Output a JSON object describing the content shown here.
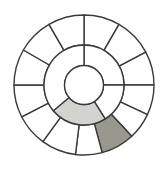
{
  "figure": {
    "type": "annular-wheel-diagram",
    "background": "#ffffff",
    "stroke_color": "#3a3a3a",
    "stroke_width": 1.4,
    "default_fill": "#fefefe",
    "center": {
      "x": 84,
      "y": 85
    },
    "radii": {
      "hole": 19.5,
      "middle": 40,
      "outer": 70
    },
    "outer_ring": {
      "boundaries_deg": [
        0,
        30,
        62,
        90,
        115,
        137,
        165,
        187,
        216,
        243,
        270,
        300,
        330
      ],
      "segment_count": 13,
      "shaded": [
        {
          "from_deg": 137,
          "to_deg": 165,
          "fill": "#98988f",
          "name": "dark-gray-sector"
        }
      ]
    },
    "inner_ring": {
      "boundaries_deg": [
        0,
        90,
        148,
        230
      ],
      "segment_count": 4,
      "shaded": [
        {
          "from_deg": 148,
          "to_deg": 230,
          "fill": "#d3d3d0",
          "name": "light-gray-sector"
        }
      ]
    }
  }
}
